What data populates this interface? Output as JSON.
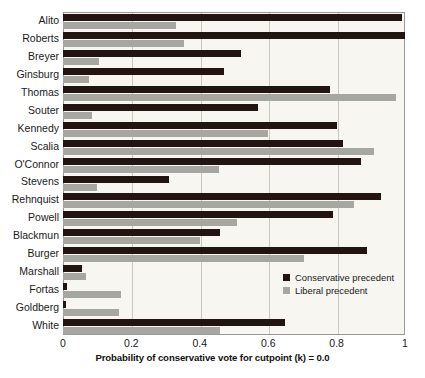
{
  "chart_data": {
    "type": "bar",
    "orientation": "horizontal",
    "title": "",
    "xlabel": "Probability of conservative vote for cutpoint (k) = 0.0",
    "ylabel": "",
    "xlim": [
      0,
      1
    ],
    "xticks": [
      "0",
      "0.2",
      "0.4",
      "0.6",
      "0.8",
      "1"
    ],
    "xtick_values": [
      0,
      0.2,
      0.4,
      0.6,
      0.8,
      1
    ],
    "grid": true,
    "grid_axis": "x",
    "legend_position": "inside-right",
    "categories": [
      "Alito",
      "Roberts",
      "Breyer",
      "Ginsburg",
      "Thomas",
      "Souter",
      "Kennedy",
      "Scalia",
      "O'Connor",
      "Stevens",
      "Rehnquist",
      "Powell",
      "Blackmun",
      "Burger",
      "Marshall",
      "Fortas",
      "Goldberg",
      "White"
    ],
    "series": [
      {
        "name": "Conservative precedent",
        "color": "#221410",
        "values": [
          0.99,
          1.0,
          0.52,
          0.47,
          0.78,
          0.57,
          0.8,
          0.82,
          0.87,
          0.31,
          0.93,
          0.79,
          0.46,
          0.89,
          0.055,
          0.012,
          0.01,
          0.65
        ]
      },
      {
        "name": "Liberal precedent",
        "color": "#a7a7a2",
        "values": [
          0.33,
          0.355,
          0.105,
          0.075,
          0.975,
          0.085,
          0.6,
          0.91,
          0.455,
          0.1,
          0.85,
          0.51,
          0.4,
          0.705,
          0.068,
          0.17,
          0.165,
          0.46
        ]
      }
    ],
    "legend": [
      {
        "label": "Conservative precedent",
        "swatch": "dark"
      },
      {
        "label": "Liberal precedent",
        "swatch": "light"
      }
    ]
  }
}
